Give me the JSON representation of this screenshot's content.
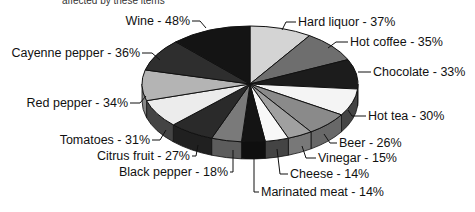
{
  "chart_data": {
    "type": "pie",
    "style": "3d-exploded-none, grayscale",
    "title": "affected by these items",
    "categories": [
      "Hard liquor",
      "Hot coffee",
      "Chocolate",
      "Hot tea",
      "Beer",
      "Vinegar",
      "Cheese",
      "Marinated meat",
      "Black pepper",
      "Citrus fruit",
      "Tomatoes",
      "Red pepper",
      "Cayenne pepper",
      "Wine"
    ],
    "values": [
      37,
      35,
      33,
      30,
      26,
      15,
      14,
      14,
      18,
      27,
      31,
      34,
      36,
      48
    ],
    "unit": "%",
    "labels": [
      "Hard liquor - 37%",
      "Hot coffee - 35%",
      "Chocolate - 33%",
      "Hot tea - 30%",
      "Beer - 26%",
      "Vinegar - 15%",
      "Cheese - 14%",
      "Marinated meat - 14%",
      "Black pepper - 18%",
      "Citrus fruit - 27%",
      "Tomatoes - 31%",
      "Red pepper - 34%",
      "Cayenne pepper - 36%",
      "Wine - 48%"
    ],
    "legend": "none (leader-line labels)"
  },
  "colors": [
    "#d4d4d4",
    "#6e6e6e",
    "#1c1c1c",
    "#f4f4f4",
    "#8a8a8a",
    "#a0a0a0",
    "#f8f8f8",
    "#141414",
    "#7a7a7a",
    "#2a2a2a",
    "#ececec",
    "#b4b4b4",
    "#2e2e2e",
    "#141414"
  ]
}
